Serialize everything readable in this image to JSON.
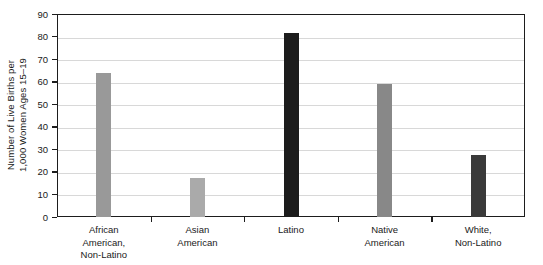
{
  "chart_data": {
    "type": "bar",
    "title": "",
    "xlabel": "",
    "ylabel": "Number of Live Births per 1,000 Women Ages 15–19",
    "ylabel_lines": [
      "Number of Live Births per",
      "1,000 Women Ages 15–19"
    ],
    "categories": [
      "African American, Non-Latino",
      "Asian American",
      "Latino",
      "Native American",
      "White, Non-Latino"
    ],
    "category_lines": [
      [
        "African",
        "American,",
        "Non-Latino"
      ],
      [
        "Asian",
        "American"
      ],
      [
        "Latino"
      ],
      [
        "Native",
        "American"
      ],
      [
        "White,",
        "Non-Latino"
      ]
    ],
    "values": [
      64,
      17.5,
      81.5,
      59,
      27.5
    ],
    "bar_colors": [
      "#999999",
      "#aaaaaa",
      "#1c1c1c",
      "#888888",
      "#3a3a3a"
    ],
    "ylim": [
      0,
      90
    ],
    "yticks": [
      0,
      10,
      20,
      30,
      40,
      50,
      60,
      70,
      80,
      90
    ],
    "ytick_labels": [
      "0",
      "10",
      "20",
      "30",
      "40",
      "50",
      "60",
      "70",
      "80",
      "90"
    ],
    "grid": true,
    "legend": "none",
    "axis_color": "#1d1d1d",
    "grid_color": "#d8d8d8",
    "background": "#ffffff"
  }
}
